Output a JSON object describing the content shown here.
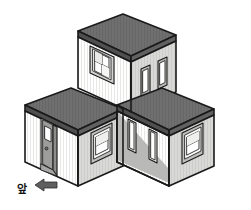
{
  "figure": {
    "background_color": "#ffffff",
    "line_color": "#1a1a1a"
  },
  "palette": {
    "roof_dark": "#6e6e6e",
    "roof_dark_edge": "#5a5a5a",
    "wall_light": "#f2f2f0",
    "wall_mid": "#d6d6d4",
    "wall_shadow": "#b9b9b7",
    "window_pane": "#ffffff",
    "window_frame": "#c9c9c7",
    "door_panel": "#9a9a98",
    "door_glass": "#ffffff",
    "arrow_fill": "#5e5e5e",
    "outline": "#1a1a1a"
  },
  "annotation": {
    "direction_label": "앞",
    "direction_label_meaning": "front",
    "arrow_icon": "left-arrow-icon",
    "arrow_direction": "left"
  },
  "blocks": [
    {
      "id": "top-block",
      "position": "back-center-raised",
      "left_face": {
        "features": [
          "cross-pane-window"
        ]
      },
      "right_face": {
        "features": [
          "narrow-window",
          "narrow-window"
        ]
      },
      "roof": "flat-dark"
    },
    {
      "id": "left-block",
      "position": "front-left-ground",
      "left_face": {
        "features": [
          "entry-door"
        ]
      },
      "right_face": {
        "features": [
          "cross-pane-window"
        ]
      },
      "roof": "flat-dark"
    },
    {
      "id": "right-block",
      "position": "front-right-ground",
      "left_face": {
        "features": [
          "narrow-window",
          "narrow-window"
        ],
        "shading": "cast-shadow"
      },
      "right_face": {
        "features": [
          "cross-pane-window"
        ]
      },
      "roof": "flat-dark"
    }
  ],
  "counts": {
    "blocks": 3,
    "doors": 1,
    "windows": 8
  }
}
